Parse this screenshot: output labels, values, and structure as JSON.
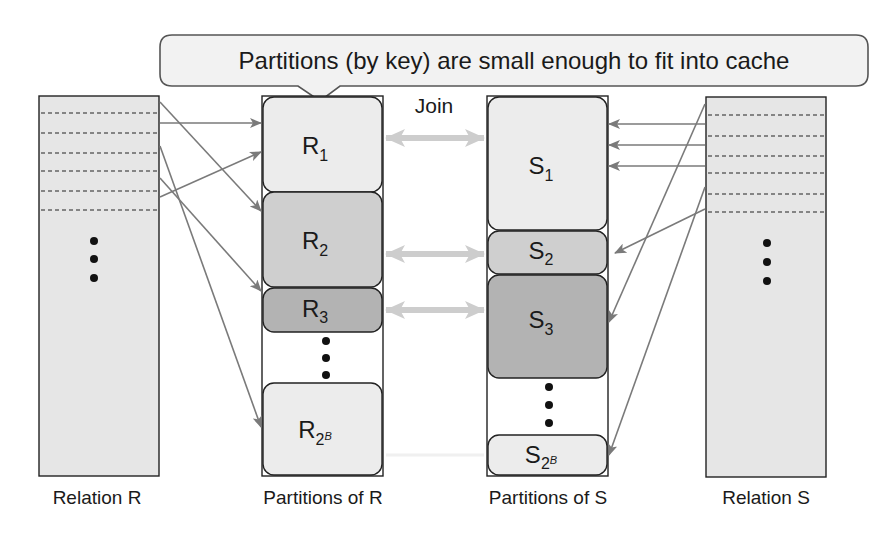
{
  "callout": {
    "text": "Partitions (by key) are small enough to fit into cache"
  },
  "join_label": "Join",
  "captions": {
    "relation_r": "Relation R",
    "partitions_r": "Partitions of R",
    "partitions_s": "Partitions of S",
    "relation_s": "Relation S"
  },
  "partitions_r": [
    {
      "base": "R",
      "sub": "1",
      "sup": "",
      "shade": "light"
    },
    {
      "base": "R",
      "sub": "2",
      "sup": "",
      "shade": "medium"
    },
    {
      "base": "R",
      "sub": "3",
      "sup": "",
      "shade": "dark"
    },
    {
      "base": "R",
      "sub": "2",
      "sup": "B",
      "shade": "light"
    }
  ],
  "partitions_s": [
    {
      "base": "S",
      "sub": "1",
      "sup": "",
      "shade": "light"
    },
    {
      "base": "S",
      "sub": "2",
      "sup": "",
      "shade": "medium"
    },
    {
      "base": "S",
      "sub": "3",
      "sup": "",
      "shade": "dark"
    },
    {
      "base": "S",
      "sub": "2",
      "sup": "B",
      "shade": "light"
    }
  ],
  "ellipsis": "⋮",
  "colors": {
    "relation_fill": "#e6e6e6",
    "light_fill": "#ececec",
    "medium_fill": "#cfcfcf",
    "dark_fill": "#b3b3b3",
    "border": "#222222",
    "arrow": "#7a7a7a",
    "join_arrow": "#cdcdcd"
  }
}
